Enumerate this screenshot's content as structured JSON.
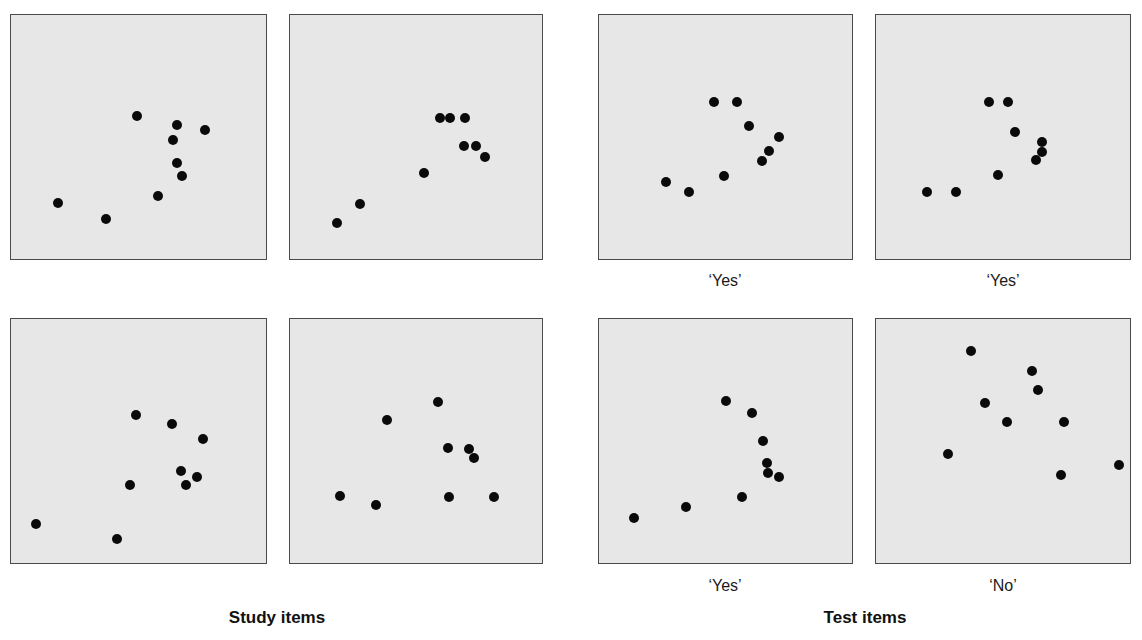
{
  "figure": {
    "groups": [
      {
        "title": "Study items",
        "center_x": 277
      },
      {
        "title": "Test items",
        "center_x": 865
      }
    ],
    "panel_fill": "#e7e7e7",
    "panel_border": "#4a4a4a",
    "dot_color": "#0a0a0a"
  },
  "chart_data": {
    "type": "scatter",
    "title": "",
    "note": "Dot-pattern stimuli; coordinates in pixels relative to each panel's top-left (panel ~256x246)",
    "panels": [
      {
        "id": "study-1",
        "group": "Study items",
        "label": "",
        "box": [
          10,
          14,
          257,
          246
        ],
        "points": [
          [
            126,
            101
          ],
          [
            166,
            110
          ],
          [
            194,
            115
          ],
          [
            162,
            125
          ],
          [
            166,
            148
          ],
          [
            171,
            161
          ],
          [
            147,
            181
          ],
          [
            47,
            188
          ],
          [
            95,
            204
          ]
        ]
      },
      {
        "id": "study-2",
        "group": "Study items",
        "label": "",
        "box": [
          289,
          14,
          254,
          246
        ],
        "points": [
          [
            150,
            103
          ],
          [
            160,
            103
          ],
          [
            175,
            103
          ],
          [
            174,
            131
          ],
          [
            186,
            131
          ],
          [
            195,
            142
          ],
          [
            134,
            158
          ],
          [
            70,
            189
          ],
          [
            47,
            208
          ]
        ]
      },
      {
        "id": "study-3",
        "group": "Study items",
        "label": "",
        "box": [
          10,
          318,
          257,
          246
        ],
        "points": [
          [
            125,
            96
          ],
          [
            161,
            105
          ],
          [
            192,
            120
          ],
          [
            170,
            152
          ],
          [
            186,
            158
          ],
          [
            175,
            166
          ],
          [
            119,
            166
          ],
          [
            25,
            205
          ],
          [
            106,
            220
          ]
        ]
      },
      {
        "id": "study-4",
        "group": "Study items",
        "label": "",
        "box": [
          289,
          318,
          254,
          246
        ],
        "points": [
          [
            148,
            83
          ],
          [
            97,
            101
          ],
          [
            158,
            129
          ],
          [
            179,
            130
          ],
          [
            184,
            139
          ],
          [
            50,
            177
          ],
          [
            86,
            186
          ],
          [
            159,
            178
          ],
          [
            204,
            178
          ]
        ]
      },
      {
        "id": "test-1",
        "group": "Test items",
        "label": "‘Yes’",
        "box": [
          598,
          14,
          255,
          246
        ],
        "points": [
          [
            115,
            87
          ],
          [
            138,
            87
          ],
          [
            150,
            111
          ],
          [
            180,
            122
          ],
          [
            170,
            136
          ],
          [
            163,
            146
          ],
          [
            125,
            161
          ],
          [
            67,
            167
          ],
          [
            90,
            177
          ]
        ]
      },
      {
        "id": "test-2",
        "group": "Test items",
        "label": "‘Yes’",
        "box": [
          875,
          14,
          256,
          246
        ],
        "points": [
          [
            113,
            87
          ],
          [
            132,
            87
          ],
          [
            139,
            117
          ],
          [
            166,
            127
          ],
          [
            166,
            137
          ],
          [
            160,
            145
          ],
          [
            122,
            160
          ],
          [
            51,
            177
          ],
          [
            80,
            177
          ]
        ]
      },
      {
        "id": "test-3",
        "group": "Test items",
        "label": "‘Yes’",
        "box": [
          598,
          318,
          255,
          246
        ],
        "points": [
          [
            127,
            82
          ],
          [
            153,
            94
          ],
          [
            164,
            122
          ],
          [
            168,
            144
          ],
          [
            169,
            154
          ],
          [
            180,
            158
          ],
          [
            143,
            178
          ],
          [
            87,
            188
          ],
          [
            35,
            199
          ]
        ]
      },
      {
        "id": "test-4",
        "group": "Test items",
        "label": "‘No’",
        "box": [
          875,
          318,
          256,
          246
        ],
        "points": [
          [
            95,
            32
          ],
          [
            156,
            52
          ],
          [
            162,
            71
          ],
          [
            109,
            84
          ],
          [
            131,
            103
          ],
          [
            188,
            103
          ],
          [
            72,
            135
          ],
          [
            243,
            146
          ],
          [
            185,
            156
          ]
        ]
      }
    ],
    "xlabel": "",
    "ylabel": "",
    "grid": false,
    "legend": "none"
  },
  "labels": {
    "test_1": "‘Yes’",
    "test_2": "‘Yes’",
    "test_3": "‘Yes’",
    "test_4": "‘No’",
    "study_title": "Study items",
    "test_title": "Test items"
  }
}
